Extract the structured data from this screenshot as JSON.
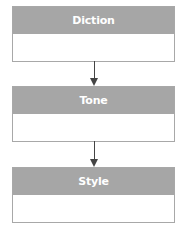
{
  "diagram": {
    "type": "flowchart",
    "direction": "top-to-bottom",
    "nodes": [
      {
        "id": "diction",
        "label": "Diction",
        "body": ""
      },
      {
        "id": "tone",
        "label": "Tone",
        "body": ""
      },
      {
        "id": "style",
        "label": "Style",
        "body": ""
      }
    ],
    "edges": [
      {
        "from": "diction",
        "to": "tone"
      },
      {
        "from": "tone",
        "to": "style"
      }
    ],
    "colors": {
      "header_fill": "#a6a6a6",
      "header_text": "#ffffff",
      "body_fill": "#ffffff",
      "border": "#a8a8a8",
      "arrow": "#444444"
    }
  }
}
